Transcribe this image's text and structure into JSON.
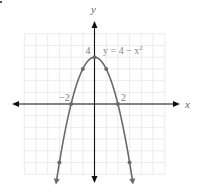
{
  "chart_data": {
    "type": "line",
    "title": "",
    "equation_label": "y = 4 − x",
    "equation_exponent": "2",
    "xlabel": "x",
    "ylabel": "y",
    "xlim": [
      -6,
      6
    ],
    "ylim": [
      -6,
      6
    ],
    "grid": true,
    "grid_step": 1,
    "function": "y = 4 - x^2",
    "series": [
      {
        "name": "y = 4 - x^2",
        "x": [
          -3.2,
          -3,
          -2,
          -1,
          0,
          1,
          2,
          3,
          3.2
        ],
        "y": [
          -6.24,
          -5,
          0,
          3,
          4,
          3,
          0,
          -5,
          -6.24
        ]
      }
    ],
    "marked_points": [
      {
        "x": -3,
        "y": -5
      },
      {
        "x": -2,
        "y": 0
      },
      {
        "x": -1,
        "y": 3
      },
      {
        "x": 0,
        "y": 4
      },
      {
        "x": 1,
        "y": 3
      },
      {
        "x": 2,
        "y": 0
      },
      {
        "x": 3,
        "y": -5
      }
    ],
    "annotations": [
      {
        "text": "−2",
        "x": -2,
        "y": 0
      },
      {
        "text": "2",
        "x": 2,
        "y": 0
      },
      {
        "text": "4",
        "x": 0,
        "y": 4
      }
    ],
    "colors": {
      "curve": "#6a6a6a",
      "axis": "#111111",
      "grid": "#e4e4e4"
    }
  }
}
